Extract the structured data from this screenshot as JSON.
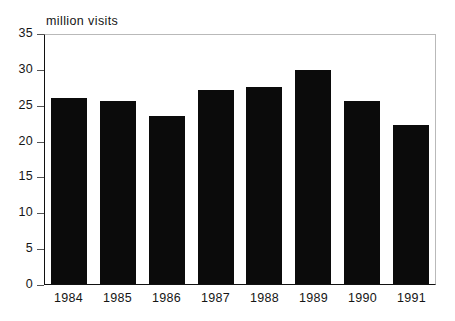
{
  "chart_data": {
    "type": "bar",
    "title": "",
    "ylabel": "million visits",
    "xlabel": "",
    "categories": [
      "1984",
      "1985",
      "1986",
      "1987",
      "1988",
      "1989",
      "1990",
      "1991"
    ],
    "values": [
      25.9,
      25.5,
      23.4,
      27.1,
      27.5,
      29.8,
      25.5,
      22.2
    ],
    "ylim": [
      0,
      35
    ],
    "ytick_labels": [
      "0",
      "5",
      "10",
      "15",
      "20",
      "25",
      "30",
      "35"
    ],
    "ytick_values": [
      0,
      5,
      10,
      15,
      20,
      25,
      30,
      35
    ],
    "grid": false,
    "legend": null,
    "bar_color": "#0b0b0b",
    "background_color": "#ffffff",
    "axis_color": "#111111",
    "frame_color": "#b9b9b9"
  }
}
